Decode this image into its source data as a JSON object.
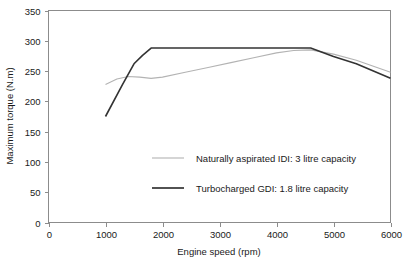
{
  "chart_data": {
    "type": "line",
    "title": "",
    "xlabel": "Engine speed (rpm)",
    "ylabel": "Maximum torque (N.m)",
    "xlim": [
      0,
      6000
    ],
    "ylim": [
      0,
      350
    ],
    "xticks": [
      0,
      1000,
      2000,
      3000,
      4000,
      5000,
      6000
    ],
    "yticks": [
      0,
      50,
      100,
      150,
      200,
      250,
      300,
      350
    ],
    "xtick_labels": [
      "0",
      "1000",
      "2000",
      "3000",
      "4000",
      "5000",
      "6000"
    ],
    "ytick_labels": [
      "0",
      "50",
      "100",
      "150",
      "200",
      "250",
      "300",
      "350"
    ],
    "grid": false,
    "legend_position": "center",
    "series": [
      {
        "name": "Naturally aspirated IDI: 3 litre capacity",
        "color": "#b3b3b3",
        "width": 1.1,
        "x": [
          1000,
          1200,
          1400,
          1600,
          1800,
          2000,
          2400,
          2800,
          3200,
          3600,
          4000,
          4300,
          4600,
          5000,
          5400,
          6000
        ],
        "y": [
          228,
          237,
          241,
          240,
          238,
          240,
          248,
          256,
          264,
          272,
          280,
          284,
          285,
          278,
          268,
          248
        ]
      },
      {
        "name": "Turbocharged GDI: 1.8 litre capacity",
        "color": "#333333",
        "width": 1.6,
        "x": [
          1000,
          1300,
          1500,
          1650,
          1800,
          2200,
          2800,
          3400,
          4000,
          4400,
          4600,
          5000,
          5400,
          6000
        ],
        "y": [
          175,
          228,
          262,
          276,
          288,
          288,
          288,
          288,
          288,
          288,
          288,
          274,
          262,
          238
        ]
      }
    ]
  },
  "axis": {
    "y_title": "Maximum torque (N.m)",
    "x_title": "Engine speed (rpm)"
  },
  "legend": {
    "entries": [
      {
        "label": "Naturally aspirated IDI: 3 litre capacity",
        "color": "#b3b3b3"
      },
      {
        "label": "Turbocharged GDI: 1.8 litre capacity",
        "color": "#333333"
      }
    ]
  },
  "colors": {
    "frame": "#8c8c8c",
    "text": "#1a1a1a",
    "background": "#ffffff",
    "series_naturally_aspirated": "#b3b3b3",
    "series_turbocharged": "#333333"
  }
}
